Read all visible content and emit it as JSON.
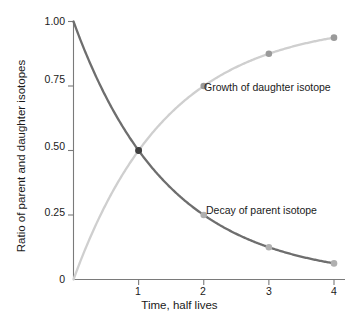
{
  "chart_data": {
    "type": "line",
    "title": "",
    "xlabel": "Time, half lives",
    "ylabel": "Ratio of parent and daughter isotopes",
    "xlim": [
      0,
      4.1
    ],
    "ylim": [
      0,
      1.0
    ],
    "grid": false,
    "legend_position": "inline-annotation",
    "xticks": [
      {
        "value": 1,
        "label": "1"
      },
      {
        "value": 2,
        "label": "2"
      },
      {
        "value": 3,
        "label": "3"
      },
      {
        "value": 4,
        "label": "4"
      }
    ],
    "yticks": [
      {
        "value": 1.0,
        "label": "1.00"
      },
      {
        "value": 0.75,
        "label": "0.75"
      },
      {
        "value": 0.5,
        "label": "0.50"
      },
      {
        "value": 0.25,
        "label": "0.25"
      },
      {
        "value": 0.0,
        "label": "0"
      }
    ],
    "x": [
      0,
      1,
      2,
      3,
      4
    ],
    "series": [
      {
        "name": "Decay of parent isotope",
        "color": "#6e6e6e",
        "marker_color": "#b0b0b0",
        "values": [
          1.0,
          0.5,
          0.25,
          0.125,
          0.0625
        ],
        "marker_x": [
          1,
          2,
          3,
          4
        ],
        "marker_y": [
          0.5,
          0.25,
          0.125,
          0.0625
        ]
      },
      {
        "name": "Growth of daughter isotope",
        "color": "#cfcfcf",
        "marker_color": "#9a9a9a",
        "values": [
          0.0,
          0.5,
          0.75,
          0.875,
          0.9375
        ],
        "marker_x": [
          1,
          2,
          3,
          4
        ],
        "marker_y": [
          0.5,
          0.75,
          0.875,
          0.9375
        ]
      }
    ],
    "annotations": [
      {
        "text": "Growth of daughter isotope",
        "x": 2.05,
        "y": 0.755
      },
      {
        "text": "Decay of parent isotope",
        "x": 2.05,
        "y": 0.265
      }
    ]
  },
  "axis": {
    "x_title": "Time, half lives",
    "y_title": "Ratio of parent and daughter isotopes",
    "x_tick_labels": [
      "1",
      "2",
      "3",
      "4"
    ],
    "y_tick_labels": [
      "1.00",
      "0.75",
      "0.50",
      "0.25",
      "0"
    ]
  },
  "annotations": {
    "growth": "Growth of daughter isotope",
    "decay": "Decay of parent isotope"
  },
  "colors": {
    "decay_curve": "#6e6e6e",
    "growth_curve": "#cfcfcf",
    "decay_marker": "#b0b0b0",
    "growth_marker": "#9a9a9a",
    "axis": "#7a7a7a",
    "text": "#1a1a1a",
    "background": "#ffffff"
  }
}
